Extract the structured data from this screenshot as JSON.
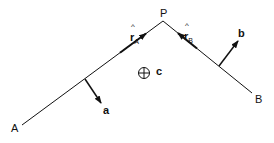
{
  "diagram": {
    "points": {
      "A": {
        "label": "A",
        "x": 22,
        "y": 125
      },
      "P": {
        "label": "P",
        "x": 163,
        "y": 21
      },
      "B": {
        "label": "B",
        "x": 252,
        "y": 93
      }
    },
    "unit_vectors": {
      "rA": {
        "hat": "^",
        "base": "r",
        "sub": "A"
      },
      "rB": {
        "hat": "^",
        "base": "r",
        "sub": "B"
      }
    },
    "vectors": {
      "a": {
        "label": "a"
      },
      "b": {
        "label": "b"
      }
    },
    "center": {
      "symbol": "⊕",
      "label": "c"
    },
    "colors": {
      "stroke": "#111111",
      "background": "#ffffff"
    }
  }
}
